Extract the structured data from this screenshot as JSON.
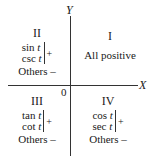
{
  "axes": {
    "x_label": "X",
    "y_label": "Y",
    "origin_label": "0"
  },
  "quadrants": {
    "I": {
      "numeral": "I",
      "text": "All positive"
    },
    "II": {
      "numeral": "II",
      "functions": [
        "sin",
        "csc"
      ],
      "variable": "t",
      "positive_sign": "+",
      "others": "Others –"
    },
    "III": {
      "numeral": "III",
      "functions": [
        "tan",
        "cot"
      ],
      "variable": "t",
      "positive_sign": "+",
      "others": "Others –"
    },
    "IV": {
      "numeral": "IV",
      "functions": [
        "cos",
        "sec"
      ],
      "variable": "t",
      "positive_sign": "+",
      "others": "Others –"
    }
  }
}
